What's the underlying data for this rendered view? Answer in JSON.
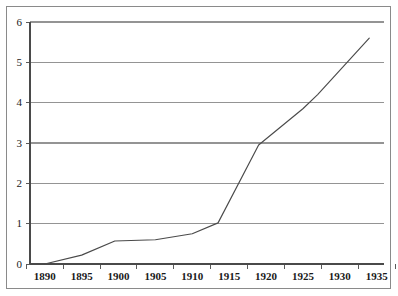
{
  "chart_data": {
    "type": "line",
    "title": "",
    "subtitle": "",
    "xlabel": "",
    "ylabel": "",
    "xlim": [
      1888,
      1936
    ],
    "ylim": [
      0,
      6
    ],
    "grid": "horizontal",
    "legend": "none",
    "x_ticks": [
      1890,
      1895,
      1900,
      1905,
      1910,
      1915,
      1920,
      1925,
      1930,
      1935
    ],
    "x_tick_labels": [
      "1890",
      "1895",
      "1900",
      "1905",
      "1910",
      "1915",
      "1920",
      "1925",
      "1930",
      "1935"
    ],
    "y_ticks": [
      0,
      1,
      2,
      3,
      4,
      5,
      6
    ],
    "y_tick_labels": [
      "0",
      "1",
      "2",
      "3",
      "4",
      "5",
      "6"
    ],
    "series": [
      {
        "name": "series-1",
        "color": "#4a4a4a",
        "x": [
          1890,
          1895,
          1899.5,
          1905,
          1910,
          1913.5,
          1919,
          1925,
          1927,
          1934
        ],
        "values": [
          0.0,
          0.22,
          0.57,
          0.6,
          0.75,
          1.02,
          2.95,
          3.85,
          4.2,
          5.6
        ]
      }
    ]
  },
  "axis": {
    "y_axis_name": "value-axis",
    "x_axis_name": "year-axis"
  },
  "colors": {
    "grid": "#949494",
    "axis": "#4a4a4a",
    "line": "#4a4a4a",
    "frame": "#8a8a8a",
    "background": "#ffffff",
    "text": "#1a1a1a"
  }
}
